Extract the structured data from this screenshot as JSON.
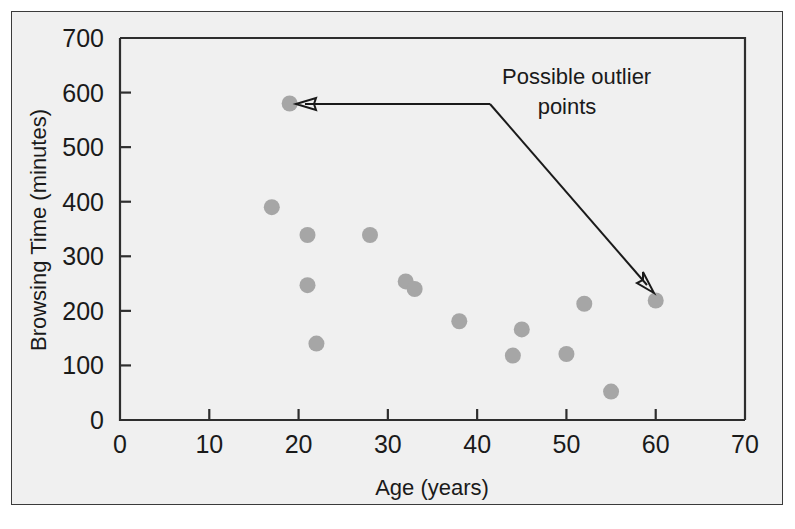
{
  "figure": {
    "background_color": "#f0f0f0",
    "frame_color": "#3b3b3b",
    "point_color": "#a6a6a6",
    "axis_color": "#2e2e2e"
  },
  "chart_data": {
    "type": "scatter",
    "title": "",
    "xlabel": "Age (years)",
    "ylabel": "Browsing Time (minutes)",
    "xlim": [
      0,
      70
    ],
    "ylim": [
      0,
      700
    ],
    "xticks": [
      0,
      10,
      20,
      30,
      40,
      50,
      60,
      70
    ],
    "xtick_labels": [
      "0",
      "10",
      "20",
      "30",
      "40",
      "50",
      "60",
      "70"
    ],
    "yticks": [
      0,
      100,
      200,
      300,
      400,
      500,
      600,
      700
    ],
    "ytick_labels": [
      "0",
      "100",
      "200",
      "300",
      "400",
      "500",
      "600",
      "700"
    ],
    "grid": false,
    "legend": null,
    "points": [
      {
        "x": 17,
        "y": 390
      },
      {
        "x": 19,
        "y": 580
      },
      {
        "x": 21,
        "y": 339
      },
      {
        "x": 21,
        "y": 247
      },
      {
        "x": 22,
        "y": 140
      },
      {
        "x": 28,
        "y": 339
      },
      {
        "x": 32,
        "y": 254
      },
      {
        "x": 33,
        "y": 240
      },
      {
        "x": 38,
        "y": 181
      },
      {
        "x": 44,
        "y": 118
      },
      {
        "x": 45,
        "y": 166
      },
      {
        "x": 50,
        "y": 121
      },
      {
        "x": 52,
        "y": 213
      },
      {
        "x": 55,
        "y": 52
      },
      {
        "x": 60,
        "y": 219
      }
    ],
    "annotations": [
      {
        "text_line1": "Possible outlier",
        "text_line2": "points",
        "targets": [
          {
            "x": 19,
            "y": 580
          },
          {
            "x": 60,
            "y": 219
          }
        ]
      }
    ]
  }
}
